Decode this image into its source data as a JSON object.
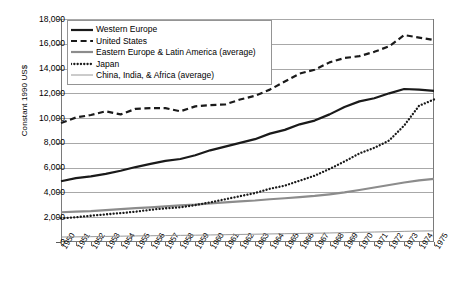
{
  "chart_data": {
    "type": "line",
    "title": "",
    "xlabel": "",
    "ylabel": "Constant 1990 US$",
    "ylim": [
      0,
      18000
    ],
    "ytick_step": 2000,
    "grid": true,
    "legend_position": "top-left",
    "ytick_labels": [
      "18,000",
      "16,000",
      "14,000",
      "12,000",
      "10,000",
      "8,000",
      "6,000",
      "4,000",
      "2,000",
      "0"
    ],
    "categories": [
      "1950",
      "1951",
      "1952",
      "1953",
      "1954",
      "1955",
      "1956",
      "1957",
      "1958",
      "1959",
      "1960",
      "1961",
      "1962",
      "1963",
      "1964",
      "1965",
      "1966",
      "1967",
      "1968",
      "1969",
      "1970",
      "1971",
      "1972",
      "1973",
      "1974",
      "1975"
    ],
    "series": [
      {
        "name": "Western Europe",
        "style": "solid-thick",
        "color": "#1a1a1a",
        "values": [
          4900,
          5150,
          5300,
          5500,
          5750,
          6050,
          6300,
          6550,
          6700,
          7000,
          7400,
          7700,
          8000,
          8300,
          8750,
          9050,
          9500,
          9800,
          10300,
          10900,
          11350,
          11600,
          12000,
          12350,
          12300,
          12200
        ]
      },
      {
        "name": "United States",
        "style": "dashed",
        "color": "#1a1a1a",
        "values": [
          9600,
          10050,
          10250,
          10550,
          10300,
          10750,
          10800,
          10800,
          10550,
          10950,
          11050,
          11100,
          11500,
          11800,
          12300,
          12950,
          13600,
          13900,
          14500,
          14850,
          15000,
          15350,
          15800,
          16700,
          16500,
          16300
        ]
      },
      {
        "name": "Eastern Europe & Latin America (average)",
        "style": "solid-gray",
        "color": "#8c8c8c",
        "values": [
          2400,
          2450,
          2500,
          2580,
          2650,
          2730,
          2800,
          2880,
          2950,
          3020,
          3120,
          3200,
          3280,
          3350,
          3450,
          3530,
          3620,
          3720,
          3850,
          4000,
          4200,
          4400,
          4600,
          4800,
          4980,
          5100
        ]
      },
      {
        "name": "Japan",
        "style": "dotted",
        "color": "#1a1a1a",
        "values": [
          1900,
          2000,
          2120,
          2230,
          2330,
          2450,
          2600,
          2720,
          2800,
          2980,
          3200,
          3450,
          3700,
          3950,
          4300,
          4550,
          4950,
          5350,
          5900,
          6500,
          7150,
          7600,
          8200,
          9400,
          11000,
          11500
        ]
      },
      {
        "name": "China, India, & Africa (average)",
        "style": "solid-thin",
        "color": "#8c8c8c",
        "values": [
          400,
          415,
          430,
          450,
          470,
          490,
          505,
          520,
          535,
          550,
          570,
          590,
          610,
          630,
          650,
          670,
          690,
          710,
          730,
          755,
          780,
          805,
          830,
          860,
          885,
          900
        ]
      }
    ]
  }
}
